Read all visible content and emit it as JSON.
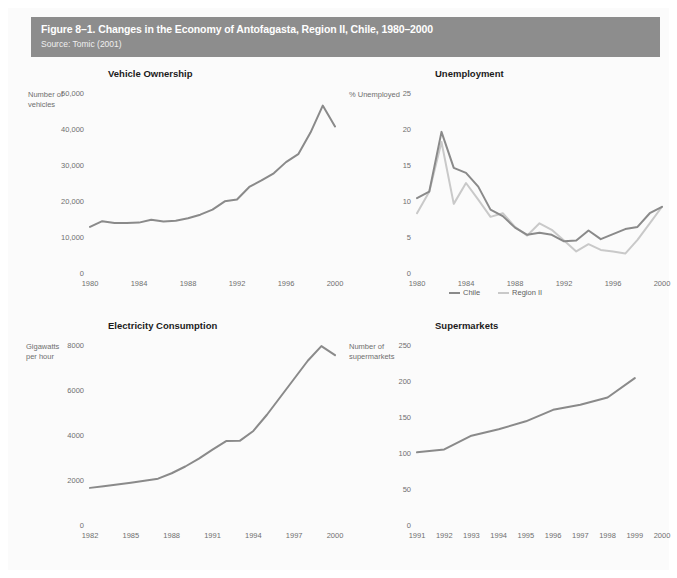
{
  "figure": {
    "title": "Figure 8–1. Changes in the Economy of Antofagasta, Region II, Chile, 1980–2000",
    "source": "Source: Tomic (2001)",
    "header_bg": "#8d8d8d",
    "page_bg": "#fbfbfb"
  },
  "colors": {
    "series_dark": "#8a8a8a",
    "series_light": "#c9c9c9",
    "axis_text": "#6f6f6f",
    "title_text": "#1b1b1b"
  },
  "chart_data": [
    {
      "id": "vehicle-ownership",
      "type": "line",
      "title": "Vehicle Ownership",
      "xlabel": "",
      "ylabel": "Number of\nvehicles",
      "ylabel_lines": [
        "Number of",
        "vehicles"
      ],
      "ylim": [
        0,
        50000
      ],
      "yticks": [
        0,
        10000,
        20000,
        30000,
        40000,
        50000
      ],
      "ytick_labels": [
        "0",
        "10,000",
        "20,000",
        "30,000",
        "40,000",
        "50,000"
      ],
      "xlim": [
        1980,
        2000
      ],
      "xticks": [
        1980,
        1984,
        1988,
        1992,
        1996,
        2000
      ],
      "xtick_labels": [
        "1980",
        "1984",
        "1988",
        "1992",
        "1996",
        "2000"
      ],
      "grid": false,
      "legend": null,
      "series": [
        {
          "name": "Vehicles",
          "color": "#8a8a8a",
          "x": [
            1980,
            1981,
            1982,
            1983,
            1984,
            1985,
            1986,
            1987,
            1988,
            1989,
            1990,
            1991,
            1992,
            1993,
            1994,
            1995,
            1996,
            1997,
            1998,
            1999,
            2000
          ],
          "values": [
            12800,
            14400,
            13900,
            13900,
            14000,
            14800,
            14300,
            14500,
            15200,
            16200,
            17600,
            19900,
            20400,
            23900,
            25700,
            27700,
            30800,
            33000,
            39000,
            46500,
            40700
          ]
        }
      ]
    },
    {
      "id": "unemployment",
      "type": "line",
      "title": "Unemployment",
      "xlabel": "",
      "ylabel": "% Unemployed",
      "ylabel_lines": [
        "% Unemployed"
      ],
      "ylim": [
        0,
        25
      ],
      "yticks": [
        0,
        5,
        10,
        15,
        20,
        25
      ],
      "ytick_labels": [
        "0",
        "5",
        "10",
        "15",
        "20",
        "25"
      ],
      "xlim": [
        1980,
        2000
      ],
      "xticks": [
        1980,
        1984,
        1988,
        1992,
        1996,
        2000
      ],
      "xtick_labels": [
        "1980",
        "1984",
        "1988",
        "1992",
        "1996",
        "2000"
      ],
      "grid": false,
      "legend": {
        "position": "bottom",
        "entries": [
          {
            "label": "Chile",
            "color": "#8a8a8a"
          },
          {
            "label": "Region II",
            "color": "#c9c9c9"
          }
        ]
      },
      "series": [
        {
          "name": "Chile",
          "color": "#8a8a8a",
          "x": [
            1980,
            1981,
            1982,
            1983,
            1984,
            1985,
            1986,
            1987,
            1988,
            1989,
            1990,
            1991,
            1992,
            1993,
            1994,
            1995,
            1996,
            1997,
            1998,
            1999,
            2000
          ],
          "values": [
            10.4,
            11.3,
            19.6,
            14.6,
            13.9,
            12.0,
            8.8,
            7.9,
            6.3,
            5.3,
            5.6,
            5.3,
            4.4,
            4.5,
            5.9,
            4.7,
            5.4,
            6.1,
            6.4,
            8.3,
            9.2
          ]
        },
        {
          "name": "Region II",
          "color": "#c9c9c9",
          "x": [
            1980,
            1981,
            1982,
            1983,
            1984,
            1985,
            1986,
            1987,
            1988,
            1989,
            1990,
            1991,
            1992,
            1993,
            1994,
            1995,
            1996,
            1997,
            1998,
            1999,
            2000
          ],
          "values": [
            8.3,
            11.3,
            18.2,
            9.6,
            12.5,
            10.2,
            7.8,
            8.3,
            6.4,
            5.2,
            6.9,
            6.0,
            4.5,
            3.0,
            4.0,
            3.2,
            3.0,
            2.7,
            4.6,
            6.9,
            9.2
          ]
        }
      ]
    },
    {
      "id": "electricity-consumption",
      "type": "line",
      "title": "Electricity Consumption",
      "xlabel": "",
      "ylabel": "Gigawatts\nper hour",
      "ylabel_lines": [
        "Gigawatts",
        "per hour"
      ],
      "ylim": [
        0,
        8000
      ],
      "yticks": [
        0,
        2000,
        4000,
        6000,
        8000
      ],
      "ytick_labels": [
        "0",
        "2000",
        "4000",
        "6000",
        "8000"
      ],
      "xlim": [
        1982,
        2000
      ],
      "xticks": [
        1982,
        1985,
        1988,
        1991,
        1994,
        1997,
        2000
      ],
      "xtick_labels": [
        "1982",
        "1985",
        "1988",
        "1991",
        "1994",
        "1997",
        "2000"
      ],
      "grid": false,
      "legend": null,
      "series": [
        {
          "name": "Gigawatts per hour",
          "color": "#8a8a8a",
          "x": [
            1982,
            1983,
            1984,
            1985,
            1986,
            1987,
            1988,
            1989,
            1990,
            1991,
            1992,
            1993,
            1994,
            1995,
            1996,
            1997,
            1998,
            1999,
            2000
          ],
          "values": [
            1650,
            1720,
            1800,
            1880,
            1970,
            2060,
            2300,
            2600,
            2950,
            3350,
            3730,
            3740,
            4180,
            4900,
            5700,
            6500,
            7300,
            7950,
            7550
          ]
        }
      ]
    },
    {
      "id": "supermarkets",
      "type": "line",
      "title": "Supermarkets",
      "xlabel": "",
      "ylabel": "Number of\nsupermarkets",
      "ylabel_lines": [
        "Number of",
        "supermarkets"
      ],
      "ylim": [
        0,
        250
      ],
      "yticks": [
        0,
        50,
        100,
        150,
        200,
        250
      ],
      "ytick_labels": [
        "0",
        "50",
        "100",
        "150",
        "200",
        "250"
      ],
      "xlim": [
        1991,
        2000
      ],
      "xticks": [
        1991,
        1992,
        1993,
        1994,
        1995,
        1996,
        1997,
        1998,
        1999,
        2000
      ],
      "xtick_labels": [
        "1991",
        "1992",
        "1993",
        "1994",
        "1995",
        "1996",
        "1997",
        "1998",
        "1999",
        "2000"
      ],
      "grid": false,
      "legend": null,
      "series": [
        {
          "name": "Supermarkets",
          "color": "#8a8a8a",
          "x": [
            1991,
            1992,
            1993,
            1994,
            1995,
            1996,
            1997,
            1998,
            1999
          ],
          "values": [
            101,
            105,
            124,
            133,
            144,
            160,
            167,
            177,
            204
          ]
        }
      ]
    }
  ]
}
